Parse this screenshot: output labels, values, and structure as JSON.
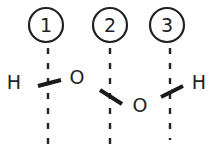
{
  "diagram": {
    "type": "molecular-structure",
    "markers": [
      {
        "label": "1",
        "cx": 46,
        "cy": 25
      },
      {
        "label": "2",
        "cx": 110,
        "cy": 25
      },
      {
        "label": "3",
        "cx": 167,
        "cy": 25
      }
    ],
    "atoms": [
      {
        "symbol": "H",
        "x": 14,
        "y": 89
      },
      {
        "symbol": "O",
        "x": 77,
        "y": 84
      },
      {
        "symbol": "O",
        "x": 140,
        "y": 112
      },
      {
        "symbol": "H",
        "x": 199,
        "y": 89
      }
    ],
    "colors": {
      "ink": "#222222",
      "background": "#ffffff"
    }
  }
}
